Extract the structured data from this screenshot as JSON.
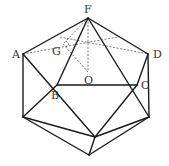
{
  "diagram": {
    "type": "icosahedron-projection",
    "labels": {
      "F": "F",
      "A": "A",
      "D": "D",
      "G": "G",
      "O": "O",
      "B": "B",
      "C": "C"
    },
    "points": {
      "F": [
        88,
        18
      ],
      "A": [
        23,
        54
      ],
      "D": [
        148,
        54
      ],
      "G": [
        63,
        44
      ],
      "O": [
        88,
        72
      ],
      "B": [
        57,
        85
      ],
      "C": [
        137,
        85
      ],
      "LL": [
        23,
        117
      ],
      "RL": [
        149,
        117
      ],
      "ML": [
        95,
        137
      ],
      "BOT": [
        89,
        155
      ]
    },
    "colors": {
      "line": "#1a1a1a",
      "dashed": "#555555",
      "label": "#333333",
      "background": "#ffffff"
    }
  }
}
